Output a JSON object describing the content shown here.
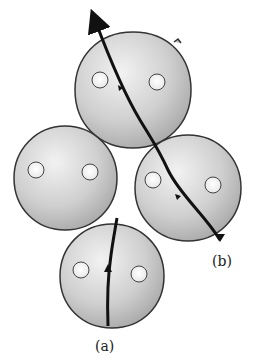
{
  "diagram": {
    "type": "particle-packing-crack-paths",
    "particles": [
      {
        "id": "top",
        "cx": 133,
        "cy": 90,
        "r": 58,
        "pores": [
          {
            "cx": 100,
            "cy": 80,
            "r": 8
          },
          {
            "cx": 157,
            "cy": 82,
            "r": 8
          }
        ]
      },
      {
        "id": "left",
        "cx": 65,
        "cy": 178,
        "r": 52,
        "pores": [
          {
            "cx": 36,
            "cy": 170,
            "r": 8
          },
          {
            "cx": 90,
            "cy": 172,
            "r": 8
          }
        ]
      },
      {
        "id": "right",
        "cx": 188,
        "cy": 188,
        "r": 53,
        "pores": [
          {
            "cx": 153,
            "cy": 180,
            "r": 8
          },
          {
            "cx": 213,
            "cy": 185,
            "r": 8
          }
        ]
      },
      {
        "id": "bottom",
        "cx": 112,
        "cy": 276,
        "r": 52,
        "pores": [
          {
            "cx": 81,
            "cy": 270,
            "r": 8
          },
          {
            "cx": 139,
            "cy": 274,
            "r": 8
          }
        ]
      }
    ],
    "paths": [
      {
        "label": "(a)",
        "description": "transgranular crack path through single particle"
      },
      {
        "label": "(b)",
        "description": "crack path along particle boundaries and through particles"
      }
    ],
    "labels": {
      "a": "(a)",
      "b": "(b)"
    },
    "colors": {
      "particle_light": "#eeeeee",
      "particle_dark": "#a9a9a9",
      "outline": "#333333",
      "path": "#111111"
    }
  }
}
